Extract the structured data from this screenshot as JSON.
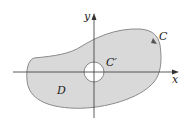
{
  "diagram": {
    "region_label": "D",
    "outer_curve_label": "C",
    "inner_curve_label": "C′",
    "x_axis_label": "x",
    "y_axis_label": "y",
    "colors": {
      "region_fill": "#d9d9d9",
      "curve_stroke": "#8a8a8a",
      "axis": "#333333",
      "hole_fill": "#ffffff"
    }
  }
}
